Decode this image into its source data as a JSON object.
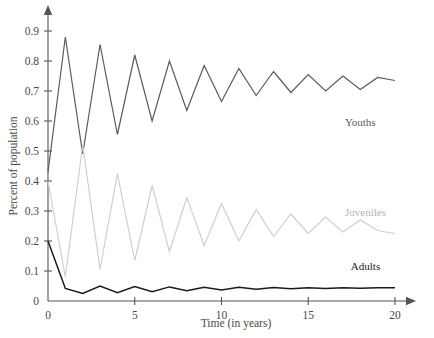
{
  "chart_data": {
    "type": "line",
    "title": "",
    "xlabel": "Time (in years)",
    "ylabel": "Percent of population",
    "xlim": [
      0,
      20
    ],
    "ylim": [
      0,
      0.95
    ],
    "xticks": [
      0,
      5,
      10,
      15,
      20
    ],
    "xtick_labels": [
      "0",
      "5",
      "10",
      "15",
      "20"
    ],
    "yticks": [
      0,
      0.1,
      0.2,
      0.3,
      0.4,
      0.5,
      0.6,
      0.7,
      0.8,
      0.9
    ],
    "ytick_labels": [
      "0",
      "0.1",
      "0.2",
      "0.3",
      "0.4",
      "0.5",
      "0.6",
      "0.7",
      "0.8",
      "0.9"
    ],
    "grid": false,
    "legend": "inline-annotations",
    "x": [
      0,
      1,
      2,
      3,
      4,
      5,
      6,
      7,
      8,
      9,
      10,
      11,
      12,
      13,
      14,
      15,
      16,
      17,
      18,
      19,
      20
    ],
    "series": [
      {
        "name": "Youths",
        "color": "#5a5a5a",
        "label_x": 18.0,
        "label_y": 0.585,
        "values": [
          0.43,
          0.88,
          0.49,
          0.855,
          0.555,
          0.82,
          0.6,
          0.8,
          0.635,
          0.785,
          0.665,
          0.775,
          0.685,
          0.765,
          0.695,
          0.755,
          0.7,
          0.75,
          0.705,
          0.745,
          0.735
        ]
      },
      {
        "name": "Juveniles",
        "color": "#cfcfcf",
        "label_x": 18.3,
        "label_y": 0.285,
        "values": [
          0.4,
          0.08,
          0.52,
          0.105,
          0.425,
          0.135,
          0.385,
          0.165,
          0.345,
          0.185,
          0.325,
          0.2,
          0.305,
          0.215,
          0.29,
          0.225,
          0.28,
          0.23,
          0.27,
          0.235,
          0.225
        ]
      },
      {
        "name": "Adults",
        "color": "#1a1a1a",
        "label_x": 18.3,
        "label_y": 0.105,
        "values": [
          0.2,
          0.042,
          0.025,
          0.05,
          0.028,
          0.048,
          0.031,
          0.047,
          0.034,
          0.046,
          0.037,
          0.0455,
          0.039,
          0.045,
          0.0405,
          0.0445,
          0.042,
          0.044,
          0.0425,
          0.0438,
          0.0445
        ]
      }
    ]
  }
}
